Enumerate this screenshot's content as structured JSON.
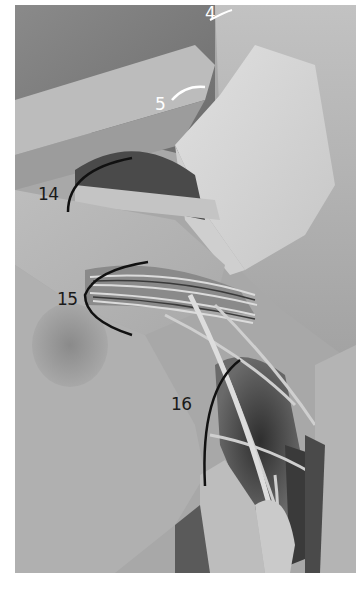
{
  "figure": {
    "type": "anatomical-photograph",
    "color_mode": "grayscale"
  },
  "labels": [
    {
      "id": "4",
      "text": "4",
      "color": "#ffffff",
      "x": 205,
      "y": 5
    },
    {
      "id": "5",
      "text": "5",
      "color": "#ffffff",
      "x": 155,
      "y": 96
    },
    {
      "id": "14",
      "text": "14",
      "color": "#1a1a1a",
      "x": 38,
      "y": 186
    },
    {
      "id": "15",
      "text": "15",
      "color": "#1a1a1a",
      "x": 57,
      "y": 291
    },
    {
      "id": "16",
      "text": "16",
      "color": "#1a1a1a",
      "x": 171,
      "y": 396
    }
  ],
  "colors": {
    "background": "#ffffff",
    "tissue_light": "#d8d8d8",
    "tissue_mid": "#a8a8a8",
    "tissue_dark": "#3a3a3a"
  }
}
